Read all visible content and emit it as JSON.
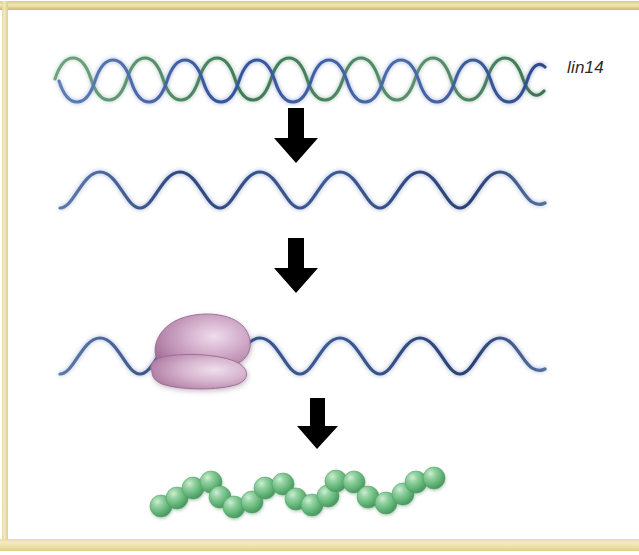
{
  "figure": {
    "gene_label": "lin14",
    "steps": [
      {
        "name": "dna",
        "label_text": "lin14",
        "description": "DNA double helix",
        "strand_colors": [
          "#3e5ba0",
          "#4f8a62"
        ],
        "turns": 9
      },
      {
        "name": "mrna",
        "description": "single-stranded mRNA wave",
        "color": "#3a5490",
        "waves": 6
      },
      {
        "name": "translation",
        "description": "ribosome bound to mRNA",
        "mrna_color": "#3a5490",
        "ribosome_color": "#b887ac",
        "ribosome_highlight": "#e7cfe2"
      },
      {
        "name": "protein",
        "description": "polypeptide chain of amino acid spheres",
        "bead_color": "#6cb97e",
        "bead_highlight": "#b8e0bf",
        "bead_count": 17
      }
    ],
    "arrows": [
      {
        "name": "arrow-transcription",
        "direction": "down"
      },
      {
        "name": "arrow-processing",
        "direction": "down"
      },
      {
        "name": "arrow-translation",
        "direction": "down"
      }
    ],
    "frame": {
      "bar_color_light": "#f2e9c0",
      "bar_color_dark": "#c9b86d",
      "background": "#ffffff"
    }
  }
}
